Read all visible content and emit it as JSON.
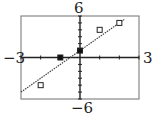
{
  "chart_data": {
    "type": "scatter",
    "title": "",
    "xlabel": "",
    "ylabel": "",
    "xlim": [
      -3,
      3
    ],
    "ylim": [
      -6,
      6
    ],
    "x_tick_step": 1,
    "y_tick_step": 1,
    "grid": false,
    "tick_labels": {
      "xmin": "−3",
      "xmax": "3",
      "ymin": "−6",
      "ymax": "6"
    },
    "points": [
      {
        "x": -2,
        "y": -4,
        "marker": "open-square"
      },
      {
        "x": -1,
        "y": 0,
        "marker": "filled-square"
      },
      {
        "x": 0,
        "y": 1,
        "marker": "filled-square"
      },
      {
        "x": 1,
        "y": 4,
        "marker": "open-square"
      },
      {
        "x": 2,
        "y": 5,
        "marker": "open-square"
      }
    ],
    "fit_line": {
      "slope": 2,
      "intercept": 1,
      "x_start": -3,
      "x_end": 2.25,
      "style": "dotted"
    }
  }
}
